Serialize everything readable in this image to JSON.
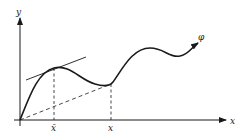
{
  "diagram": {
    "axes": {
      "x_label": "x",
      "y_label": "y"
    },
    "curve": {
      "label": "φ"
    },
    "ticks": {
      "x_bar_label": "x̄",
      "x_label": "x"
    },
    "annotations": {
      "tangent": "tangent line at x̄",
      "chord": "chord from origin to (x, φ(x))"
    },
    "colors": {
      "ink": "#1a1a1a",
      "background": "#ffffff"
    }
  }
}
